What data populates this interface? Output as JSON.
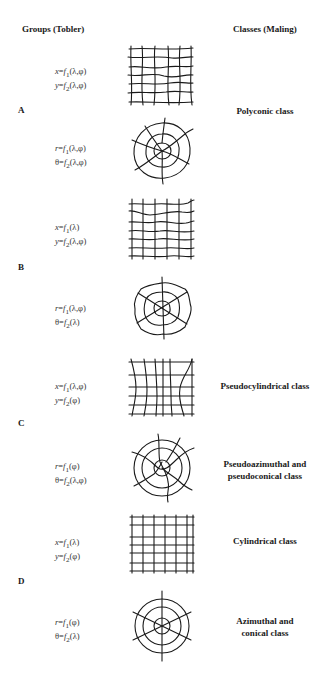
{
  "headers": {
    "left": "Groups (Tobler)",
    "right": "Classes (Maling)"
  },
  "groups": [
    {
      "letter": "A"
    },
    {
      "letter": "B"
    },
    {
      "letter": "C"
    },
    {
      "letter": "D"
    }
  ],
  "rows": [
    {
      "formula_line1": "x=f1(λ,φ)",
      "formula_line2": "y=f2(λ,φ)",
      "figure": "irregular-grid",
      "class_label": ""
    },
    {
      "formula_line1": "r=f1(λ,φ)",
      "formula_line2": "θ=f2(λ,φ)",
      "figure": "irregular-polar-grid",
      "class_label": "Polyconic class"
    },
    {
      "formula_line1": "x=f1(λ)",
      "formula_line2": "y=f2(λ,φ)",
      "figure": "grid-wavy-parallels",
      "class_label": ""
    },
    {
      "formula_line1": "r=f1(λ,φ)",
      "formula_line2": "θ=f2(λ)",
      "figure": "polar-wavy-circles",
      "class_label": ""
    },
    {
      "formula_line1": "x=f1(λ,φ)",
      "formula_line2": "y=f2(φ)",
      "figure": "pseudocylindrical-grid",
      "class_label": "Pseudocylindrical class"
    },
    {
      "formula_line1": "r=f1(φ)",
      "formula_line2": "θ=f2(λ,φ)",
      "figure": "pseudoazimuthal-grid",
      "class_label_line1": "Pseudoazimuthal and",
      "class_label_line2": "pseudoconical class"
    },
    {
      "formula_line1": "x=f1(λ)",
      "formula_line2": "y=f2(φ)",
      "figure": "rectangular-grid",
      "class_label": "Cylindrical class"
    },
    {
      "formula_line1": "r=f1(φ)",
      "formula_line2": "θ=f2(λ)",
      "figure": "concentric-radial-grid",
      "class_label_line1": "Azimuthal and",
      "class_label_line2": "conical class"
    }
  ],
  "formulas": [
    {
      "l1": {
        "v": "x",
        "f": "f",
        "s": "1",
        "a": "(λ,φ)"
      },
      "l2": {
        "v": "y",
        "f": "f",
        "s": "2",
        "a": "(λ,φ)"
      }
    },
    {
      "l1": {
        "v": "r",
        "f": "f",
        "s": "1",
        "a": "(λ,φ)"
      },
      "l2": {
        "v": "θ",
        "f": "f",
        "s": "2",
        "a": "(λ,φ)"
      }
    },
    {
      "l1": {
        "v": "x",
        "f": "f",
        "s": "1",
        "a": "(λ)"
      },
      "l2": {
        "v": "y",
        "f": "f",
        "s": "2",
        "a": "(λ,φ)"
      }
    },
    {
      "l1": {
        "v": "r",
        "f": "f",
        "s": "1",
        "a": "(λ,φ)"
      },
      "l2": {
        "v": "θ",
        "f": "f",
        "s": "2",
        "a": "(λ)"
      }
    },
    {
      "l1": {
        "v": "x",
        "f": "f",
        "s": "1",
        "a": "(λ,φ)"
      },
      "l2": {
        "v": "y",
        "f": "f",
        "s": "2",
        "a": "(φ)"
      }
    },
    {
      "l1": {
        "v": "r",
        "f": "f",
        "s": "1",
        "a": "(φ)"
      },
      "l2": {
        "v": "θ",
        "f": "f",
        "s": "2",
        "a": "(λ,φ)"
      }
    },
    {
      "l1": {
        "v": "x",
        "f": "f",
        "s": "1",
        "a": "(λ)"
      },
      "l2": {
        "v": "y",
        "f": "f",
        "s": "2",
        "a": "(φ)"
      }
    },
    {
      "l1": {
        "v": "r",
        "f": "f",
        "s": "1",
        "a": "(φ)"
      },
      "l2": {
        "v": "θ",
        "f": "f",
        "s": "2",
        "a": "(λ)"
      }
    }
  ],
  "classes": {
    "polyconic": "Polyconic class",
    "pseudocylindrical": "Pseudocylindrical class",
    "pseudoazimuthal_l1": "Pseudoazimuthal and",
    "pseudoazimuthal_l2": "pseudoconical class",
    "cylindrical": "Cylindrical class",
    "azimuthal_l1": "Azimuthal and",
    "azimuthal_l2": "conical class"
  },
  "colors": {
    "ink": "#1a1a1a",
    "background": "#ffffff"
  }
}
